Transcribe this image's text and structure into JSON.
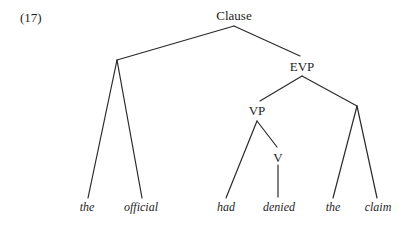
{
  "example_number": "(17)",
  "tree": {
    "nodes": {
      "clause": "Clause",
      "evp": "EVP",
      "vp": "VP",
      "v": "V"
    },
    "leaves": [
      "the",
      "official",
      "had",
      "denied",
      "the",
      "claim"
    ]
  }
}
